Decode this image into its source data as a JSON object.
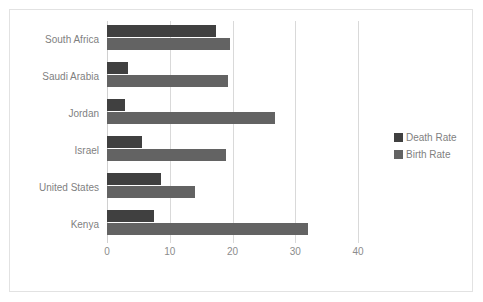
{
  "chart_data": {
    "type": "bar",
    "orientation": "horizontal",
    "title": "",
    "xlabel": "",
    "ylabel": "",
    "xlim": [
      0,
      40
    ],
    "xticks": [
      0,
      10,
      20,
      30,
      40
    ],
    "xtick_labels": [
      "0",
      "10",
      "20",
      "30",
      "40"
    ],
    "grid": true,
    "legend_position": "right",
    "categories": [
      "South Africa",
      "Saudi Arabia",
      "Jordan",
      "Israel",
      "United States",
      "Kenya"
    ],
    "series": [
      {
        "name": "Death Rate",
        "color": "#404040",
        "values": [
          17.4,
          3.3,
          2.8,
          5.6,
          8.6,
          7.5
        ]
      },
      {
        "name": "Birth Rate",
        "color": "#636363",
        "values": [
          19.6,
          19.3,
          26.7,
          19.0,
          14.0,
          32.0
        ]
      }
    ]
  },
  "legend": {
    "items": [
      {
        "label": "Death Rate",
        "color": "#404040"
      },
      {
        "label": "Birth Rate",
        "color": "#636363"
      }
    ]
  },
  "colors": {
    "death_rate": "#404040",
    "birth_rate": "#636363",
    "gridline": "#d9d9d9",
    "frame_border": "#e2e2e2",
    "tick_text": "#8c8c8c",
    "label_text": "#7f7f7f",
    "background": "#ffffff"
  }
}
